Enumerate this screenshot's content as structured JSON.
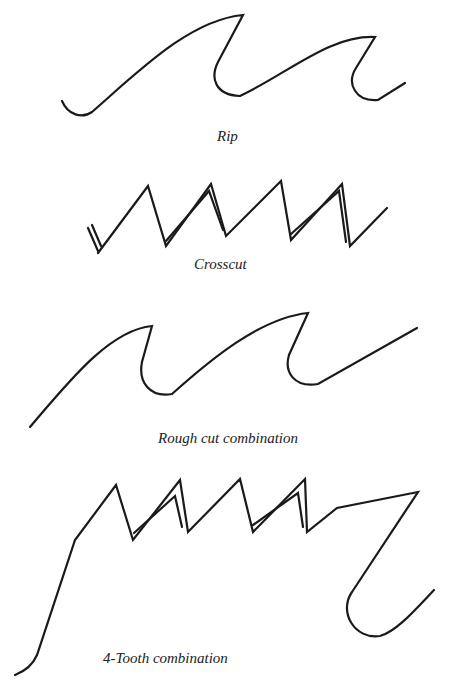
{
  "figures": [
    {
      "id": "rip",
      "caption": "Rip"
    },
    {
      "id": "crosscut",
      "caption": "Crosscut"
    },
    {
      "id": "rough-cut",
      "caption": "Rough cut combination"
    },
    {
      "id": "four-tooth",
      "caption": "4-Tooth combination"
    }
  ],
  "colors": {
    "line": "#1a1a1a",
    "background": "#ffffff"
  }
}
